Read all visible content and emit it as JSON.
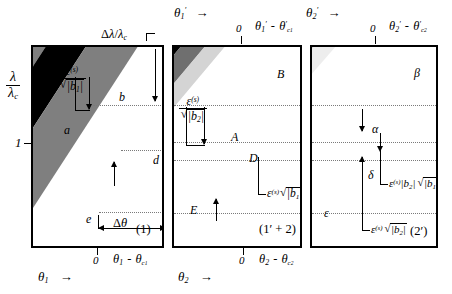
{
  "figure": {
    "type": "schematic-diagram",
    "panels": [
      {
        "id": "panel-1",
        "tag": "(1)",
        "x_axis_label": "θ₁  →",
        "x_axis_zero": "0",
        "x_axis_right": "θ₁ - θc₁",
        "y_axis_label_num": "λ",
        "y_axis_label_den": "λc",
        "y_tick": "1",
        "annotations": [
          "a",
          "b",
          "d",
          "e"
        ],
        "width_label": "Δλ/λc",
        "band_width_label_num": "ε(s)",
        "band_width_label_den": "√|b₁|",
        "delta_theta_label": "Δθ"
      },
      {
        "id": "panel-2",
        "tag": "(1' + 2)",
        "x_axis_label": "θ₂  →",
        "x_axis_zero": "0",
        "x_axis_right": "θ₂ - θc₂",
        "top_axis_label": "θ₁'  →",
        "top_axis_zero": "0",
        "top_axis_right": "θ₁' - θ'c₁",
        "annotations": [
          "A",
          "B",
          "D",
          "E"
        ],
        "band_width_label_num": "ε(s)",
        "band_width_label_den": "√|b₂|",
        "inner_label": "ε(s) √|b₁|"
      },
      {
        "id": "panel-3",
        "tag": "(2')",
        "x_axis_label": "",
        "top_axis_label": "θ₂'  →",
        "top_axis_zero": "0",
        "top_axis_right": "θ₂' - θ'c₂",
        "annotations": [
          "α",
          "β",
          "δ",
          "ε"
        ],
        "inner_label": "ε(s)|b₂| √|b₁|",
        "outer_label": "ε(s) √|b₂|"
      }
    ],
    "colors": {
      "dark": "#000000",
      "mid_gray": "#7f7f7f",
      "light_gray": "#c8c8c8",
      "pale_gray": "#e2e2e2",
      "frame": "#000000",
      "grid": "#7a7a7a",
      "background": "#ffffff"
    }
  },
  "labels": {
    "p1": {
      "a": "a",
      "b": "b",
      "d": "d",
      "e": "e",
      "dlambda": "Δλ/λ",
      "dlambda_sub": "c",
      "dtheta_delta": "Δ",
      "dtheta_theta": "θ",
      "eps": "ε",
      "eps_sup": "(s)",
      "b1": "b",
      "b1_sub": "1",
      "lam": "λ",
      "lamc": "λ",
      "lamc_sub": "c",
      "one": "1",
      "zero": "0",
      "theta": "θ",
      "theta_sub": "1",
      "arrow": "→",
      "thetac_sub": "c",
      "thetac_sub2": "1",
      "minus": "-",
      "tag": "(1)"
    },
    "p2": {
      "A": "A",
      "B": "B",
      "D": "D",
      "E": "E",
      "eps": "ε",
      "eps_sup": "(s)",
      "b2": "b",
      "b2_sub": "2",
      "b1": "b",
      "b1_sub": "1",
      "zero": "0",
      "theta": "θ",
      "theta_sub": "2",
      "arrow": "→",
      "prime": "′",
      "minus": "-",
      "tag": "(1′ + 2)"
    },
    "p3": {
      "alpha": "α",
      "beta": "β",
      "delta": "δ",
      "epsilon": "ε",
      "eps": "ε",
      "eps_sup": "(s)",
      "b2": "b",
      "b2_sub": "2",
      "b1": "b",
      "b1_sub": "1",
      "zero": "0",
      "theta": "θ",
      "theta_sub": "2",
      "arrow": "→",
      "prime": "′",
      "minus": "-",
      "tag": "(2′)"
    }
  }
}
